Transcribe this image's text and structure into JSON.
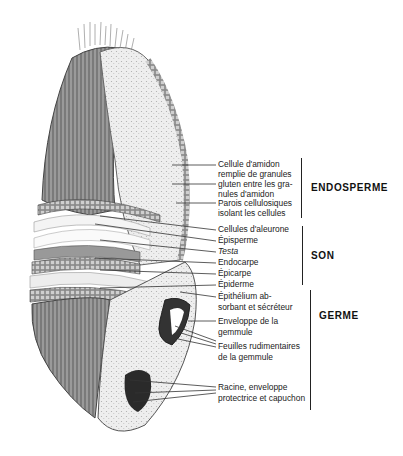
{
  "diagram": {
    "groups": [
      {
        "name": "ENDOSPERME",
        "labels": [
          "Cellule d'amidon",
          "remplie de granules",
          "gluten entre les gra-",
          "nules d'amidon",
          "Parois cellulosiques",
          "isolant les cellules"
        ]
      },
      {
        "name": "SON",
        "labels": [
          "Cellules d'aleurone",
          "Épisperme",
          "Testa",
          "Endocarpe",
          "Épicarpe",
          "Épiderme"
        ]
      },
      {
        "name": "GERME",
        "labels": [
          "Épithélium ab-",
          "sorbant et sécréteur",
          "Enveloppe de la",
          "gemmule",
          "Feuilles rudimentaires",
          "de la gemmule",
          "Racine, enveloppe",
          "protectrice et capuchon"
        ]
      }
    ]
  }
}
